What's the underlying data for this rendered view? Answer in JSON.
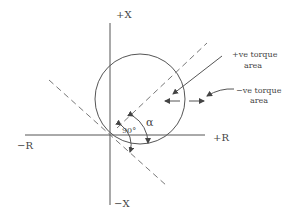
{
  "diagram": {
    "axes": {
      "pos_x_label": "+X",
      "neg_x_label": "−X",
      "pos_r_label": "+R",
      "neg_r_label": "−R"
    },
    "annotations": {
      "angle_alpha": "α",
      "angle_90": "90°",
      "pos_torque_line1": "+ve torque",
      "pos_torque_line2": "area",
      "neg_torque_line1": "−ve torque",
      "neg_torque_line2": "area"
    },
    "colors": {
      "line": "#555555",
      "dashed": "#777777",
      "text": "#444444"
    }
  }
}
